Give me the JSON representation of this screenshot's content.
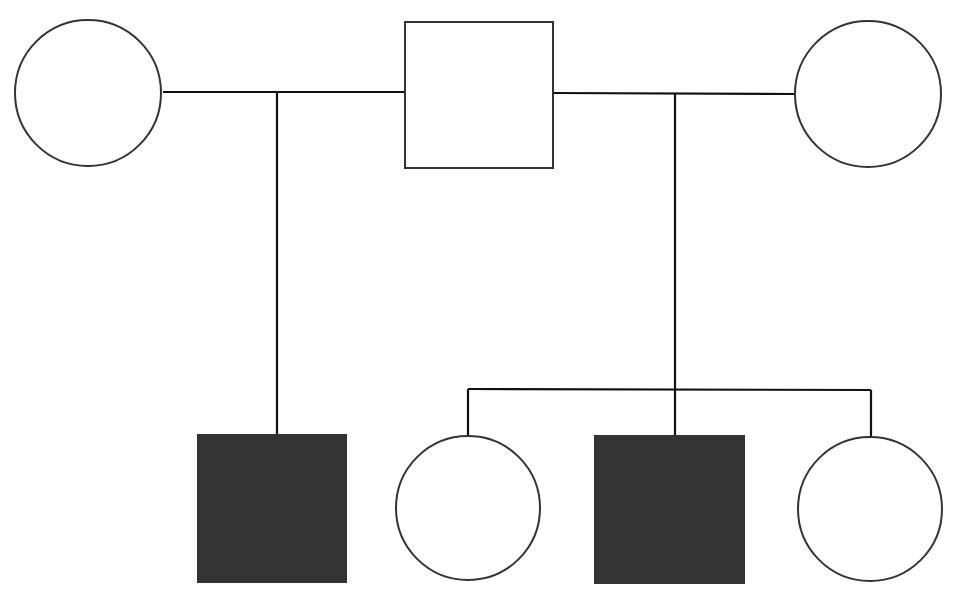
{
  "diagram": {
    "type": "pedigree",
    "width": 959,
    "height": 604,
    "colors": {
      "background": "#ffffff",
      "stroke": "#333333",
      "line": "#111111",
      "affected_fill": "#333333",
      "unaffected_fill": "#ffffff"
    },
    "individuals": [
      {
        "id": "gen1-female-left",
        "sex": "female",
        "affected": false,
        "shape": "circle",
        "cx": 88,
        "cy": 93,
        "r": 73
      },
      {
        "id": "gen1-male-center",
        "sex": "male",
        "affected": false,
        "shape": "square",
        "x": 405,
        "y": 22,
        "w": 148,
        "h": 146
      },
      {
        "id": "gen1-female-right",
        "sex": "female",
        "affected": false,
        "shape": "circle",
        "cx": 868,
        "cy": 94,
        "r": 73
      },
      {
        "id": "gen2-male-1",
        "sex": "male",
        "affected": true,
        "shape": "square",
        "x": 198,
        "y": 435,
        "w": 148,
        "h": 147
      },
      {
        "id": "gen2-female-2",
        "sex": "female",
        "affected": false,
        "shape": "circle",
        "cx": 468,
        "cy": 508,
        "r": 72
      },
      {
        "id": "gen2-male-3",
        "sex": "male",
        "affected": true,
        "shape": "square",
        "x": 595,
        "y": 436,
        "w": 149,
        "h": 147
      },
      {
        "id": "gen2-female-4",
        "sex": "female",
        "affected": false,
        "shape": "circle",
        "cx": 870,
        "cy": 509,
        "r": 72
      }
    ],
    "lines": [
      {
        "id": "marriage-line-left",
        "x1": 163,
        "y1": 92,
        "x2": 405,
        "y2": 92
      },
      {
        "id": "descent-line-left",
        "x1": 277,
        "y1": 92,
        "x2": 277,
        "y2": 435
      },
      {
        "id": "marriage-line-right",
        "x1": 553,
        "y1": 93,
        "x2": 796,
        "y2": 94
      },
      {
        "id": "descent-line-right",
        "x1": 675,
        "y1": 94,
        "x2": 675,
        "y2": 436
      },
      {
        "id": "sibship-line",
        "x1": 468,
        "y1": 389,
        "x2": 871,
        "y2": 390
      },
      {
        "id": "sibling-drop-2",
        "x1": 468,
        "y1": 389,
        "x2": 468,
        "y2": 436
      },
      {
        "id": "sibling-drop-4",
        "x1": 871,
        "y1": 390,
        "x2": 871,
        "y2": 437
      }
    ]
  }
}
